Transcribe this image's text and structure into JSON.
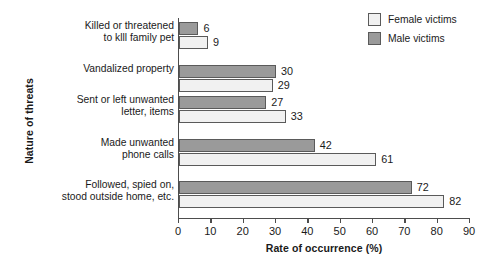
{
  "chart_data": {
    "type": "bar",
    "orientation": "horizontal",
    "title": "",
    "xlabel": "Rate of occurrence (%)",
    "ylabel": "Nature of threats",
    "xlim": [
      0,
      90
    ],
    "xticks": [
      "0",
      "10",
      "20",
      "30",
      "40",
      "50",
      "60",
      "70",
      "80",
      "90"
    ],
    "grid": false,
    "legend_position": "top-right",
    "categories": [
      "Killed or threatened\nto klll family pet",
      "Vandalized property",
      "Sent or left unwanted\nletter, items",
      "Made unwanted\nphone calls",
      "Followed, spied on,\nstood outside home, etc."
    ],
    "series": [
      {
        "name": "Male victims",
        "color": "#9a9a9a",
        "values": [
          6,
          30,
          27,
          42,
          72
        ]
      },
      {
        "name": "Female victims",
        "color": "#f1f1f1",
        "values": [
          9,
          29,
          33,
          61,
          82
        ]
      }
    ]
  },
  "legend": {
    "items": [
      {
        "label": "Female victims",
        "swatch": "female"
      },
      {
        "label": "Male victims",
        "swatch": "male"
      }
    ]
  }
}
